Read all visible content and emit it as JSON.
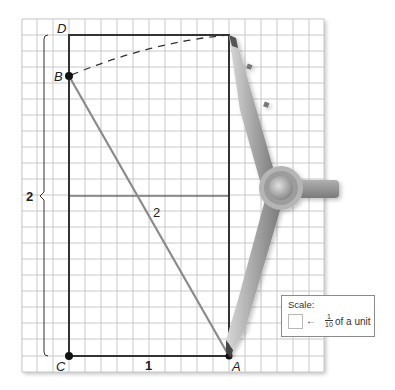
{
  "figure": {
    "points": {
      "A": "A",
      "B": "B",
      "C": "C",
      "D": "D"
    },
    "labels": {
      "side_bottom": "1",
      "side_left": "2",
      "diagonal": "2"
    },
    "grid": {
      "left": 22,
      "top": 19,
      "right": 324,
      "bottom": 372,
      "cell": 16,
      "line_color": "#c8c8c8"
    },
    "colors": {
      "rectangle": "#333333",
      "diagonal": "#8a8a8a",
      "compass": "#9a9a9a"
    }
  },
  "scale": {
    "title": "Scale:",
    "arrow": "←",
    "fraction_num": "1",
    "fraction_den": "10",
    "text": "of a unit"
  }
}
